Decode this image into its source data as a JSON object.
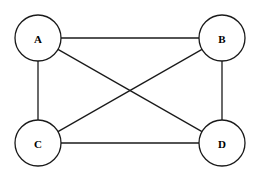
{
  "figure": {
    "kind": "undirected-graph-diagram",
    "width": 258,
    "height": 178,
    "background_color": "#ffffff",
    "stroke_color": "#1a1a1a",
    "label_color": "#000000",
    "stroke_width": 1.3,
    "node_radius": 23
  },
  "chart_data": {
    "type": "diagram",
    "title": "",
    "xlabel": "",
    "ylabel": "",
    "graph_type": "complete-graph-K4",
    "directed": false,
    "weighted": false,
    "node_count": 4,
    "edge_count": 6,
    "nodes": [
      {
        "id": "A",
        "label": "A",
        "cx": 38,
        "cy": 38,
        "r": 23
      },
      {
        "id": "B",
        "label": "B",
        "cx": 222,
        "cy": 38,
        "r": 23
      },
      {
        "id": "C",
        "label": "C",
        "cx": 38,
        "cy": 143,
        "r": 23
      },
      {
        "id": "D",
        "label": "D",
        "cx": 222,
        "cy": 143,
        "r": 23
      }
    ],
    "edges": [
      {
        "id": "A-B",
        "source": "A",
        "target": "B",
        "kind": "top-horizontal"
      },
      {
        "id": "C-D",
        "source": "C",
        "target": "D",
        "kind": "bottom-horizontal"
      },
      {
        "id": "A-C",
        "source": "A",
        "target": "C",
        "kind": "left-vertical"
      },
      {
        "id": "B-D",
        "source": "B",
        "target": "D",
        "kind": "right-vertical"
      },
      {
        "id": "A-D",
        "source": "A",
        "target": "D",
        "kind": "diagonal"
      },
      {
        "id": "B-C",
        "source": "B",
        "target": "C",
        "kind": "diagonal"
      }
    ],
    "crossing_point": {
      "x": 130,
      "y": 90
    }
  }
}
